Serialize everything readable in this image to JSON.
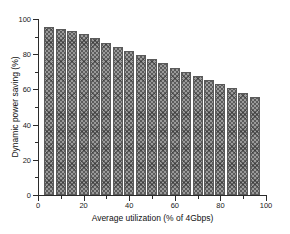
{
  "chart_data": {
    "type": "bar",
    "title": "",
    "xlabel": "Average utilization (% of 4Gbps)",
    "ylabel": "Dynamic power saving (%)",
    "xlim": [
      0,
      100
    ],
    "ylim": [
      0,
      100
    ],
    "grid": false,
    "legend": null,
    "x_ticks": [
      0,
      20,
      40,
      60,
      80,
      100
    ],
    "x_tick_labels": [
      "0",
      "20",
      "40",
      "60",
      "80",
      "100"
    ],
    "x_minor_ticks": [
      10,
      30,
      50,
      70,
      90
    ],
    "y_ticks": [
      0,
      20,
      40,
      60,
      80,
      100
    ],
    "y_tick_labels": [
      "0",
      "20",
      "40",
      "60",
      "80",
      "100"
    ],
    "y_minor_ticks": [
      10,
      30,
      50,
      70,
      90
    ],
    "bar_width": 4.4,
    "bar_fill": "#9a9a9a",
    "bar_edge": "#5a5a5a",
    "bar_hatch": "crosshatch",
    "categories": [
      5,
      10,
      15,
      20,
      25,
      30,
      35,
      40,
      45,
      50,
      55,
      60,
      65,
      70,
      75,
      80,
      85,
      90,
      95
    ],
    "values": [
      95.6,
      94.3,
      93.0,
      91.2,
      89.0,
      86.6,
      84.3,
      81.8,
      79.5,
      77.3,
      74.9,
      72.4,
      70.0,
      67.8,
      65.5,
      63.0,
      60.6,
      58.2,
      55.7
    ]
  },
  "figure": {
    "background": "#ffffff",
    "axis_color": "#2b2b2b",
    "text_color": "#111111"
  }
}
